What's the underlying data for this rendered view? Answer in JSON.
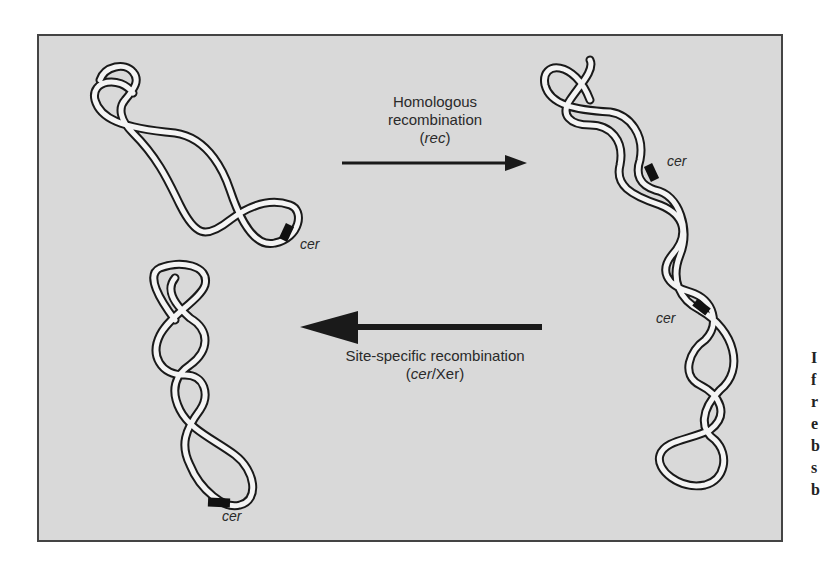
{
  "figure": {
    "background_color": "#d9d9d9",
    "border_color": "#444444",
    "ink_color": "#1a1a1a",
    "cer_marker_color": "#111111"
  },
  "top_arrow": {
    "direction": "right",
    "line1": "Homologous",
    "line2": "recombination",
    "line3_open": "(",
    "line3_italic": "rec",
    "line3_close": ")"
  },
  "bottom_arrow": {
    "direction": "left",
    "line1": "Site-specific recombination",
    "line2_open": "(",
    "line2_italic": "cer",
    "line2_rest": "/Xer)"
  },
  "molecules": [
    {
      "id": "monomer-top-left",
      "site_label": "cer"
    },
    {
      "id": "dimer-right",
      "site_labels": [
        "cer",
        "cer"
      ]
    },
    {
      "id": "monomer-bottom-left",
      "site_label": "cer"
    }
  ],
  "cut_off_side_text": [
    "I",
    "f",
    "r",
    "e",
    "b",
    "s",
    "b"
  ]
}
